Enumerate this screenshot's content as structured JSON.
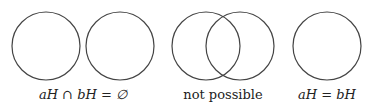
{
  "diagram": {
    "stroke_color": "#444444",
    "stroke_width": 1.2,
    "panels": [
      {
        "id": "disjoint",
        "circles": [
          {
            "cx": 46,
            "cy": 46,
            "r": 34
          },
          {
            "cx": 120,
            "cy": 46,
            "r": 34
          }
        ],
        "label": "aH ∩ bH = ∅",
        "label_center_x": 83
      },
      {
        "id": "overlapping",
        "circles": [
          {
            "cx": 206,
            "cy": 46,
            "r": 34
          },
          {
            "cx": 240,
            "cy": 46,
            "r": 34
          }
        ],
        "label": "not possible",
        "label_center_x": 223
      },
      {
        "id": "equal",
        "circles": [
          {
            "cx": 327,
            "cy": 46,
            "r": 34
          }
        ],
        "label": "aH = bH",
        "label_center_x": 327
      }
    ]
  }
}
